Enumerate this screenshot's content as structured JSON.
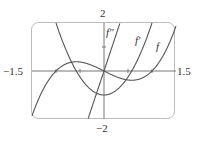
{
  "chart_data": {
    "type": "line",
    "title": "",
    "xlabel": "",
    "ylabel": "",
    "xlim": [
      -1.5,
      1.5
    ],
    "ylim": [
      -2,
      2
    ],
    "grid": false,
    "legend": "inline labels",
    "x_tick_labels": [
      "-1.5",
      "1.5"
    ],
    "y_tick_labels": [
      "2",
      "-2"
    ],
    "x_ticks": [
      -1,
      -0.5,
      0.5,
      1
    ],
    "y_ticks": [
      1
    ],
    "series": [
      {
        "name": "f",
        "label": "f",
        "formula": "x^3 - x",
        "x": [
          -1.5,
          -1,
          -0.577,
          0,
          0.577,
          1,
          1.5
        ],
        "values": [
          -1.875,
          0,
          0.385,
          0,
          -0.385,
          0,
          1.875
        ]
      },
      {
        "name": "f'",
        "label": "f′",
        "formula": "3x^2 - 1",
        "x": [
          -1,
          -0.577,
          0,
          0.577,
          1
        ],
        "values": [
          2,
          0,
          -1,
          0,
          2
        ]
      },
      {
        "name": "f''",
        "label": "f″",
        "formula": "6x",
        "x": [
          -0.333,
          0,
          0.333
        ],
        "values": [
          -2,
          0,
          2
        ]
      }
    ]
  },
  "labels": {
    "x_min": "−1.5",
    "x_max": "1.5",
    "y_max": "2",
    "y_min": "−2",
    "f": "f",
    "f_prime": "f′",
    "f_double_prime": "f″"
  },
  "colors": {
    "curve": "#555555",
    "axis": "#777777",
    "frame": "#bbbbbb"
  }
}
